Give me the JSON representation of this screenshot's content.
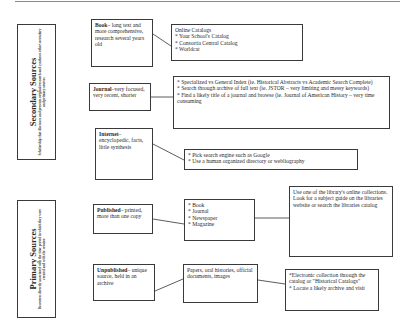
{
  "sections": {
    "secondary": {
      "title": "Secondary Sources",
      "subtitle": "Scholarship that discusses and presents original research and syntheses other secondary and primary sources"
    },
    "primary": {
      "title": "Primary Sources",
      "subtitle": "Resources directly associated with the time period in which they were created and with the creator."
    }
  },
  "nodes": {
    "book": {
      "term": "Book",
      "desc": "– long text and more comprehensive, research several years old"
    },
    "online_catalogs": {
      "heading": "Online Catalogs",
      "items": [
        "* Your School's  Catalog",
        "* Consortia Central Catalog",
        "* Worldcat"
      ]
    },
    "journal": {
      "term": "Journal",
      "desc": "–very focused, very recent, shorter"
    },
    "index": {
      "items": [
        "* Specialized vs General Index (ie. Historical Abstracts vs Academic Search Complete)",
        "* Search through archive of full text (ie. JSTOR – very limiting and messy keywords)",
        "* Find a likely title of a journal and browse (ie. Journal of American History – very time consuming"
      ]
    },
    "internet": {
      "term": "Internet",
      "desc": "– encyclopedic, facts, little synthesis"
    },
    "search_engine": {
      "items": [
        "* Pick search engine such as Google",
        "* Use a human organized directory or webliography"
      ]
    },
    "published": {
      "term": "Published",
      "desc": "– printed, more than one copy"
    },
    "published_types": {
      "items": [
        "* Book",
        "* Journal",
        "* Newspaper",
        "* Magazine"
      ]
    },
    "library_collections": {
      "text": "Use one of the library's online collections. Look for a subject guide on the libraries website or search the libraries catalog"
    },
    "unpublished": {
      "term": "Unpublished",
      "desc": "– unique source, held in an archive"
    },
    "unpublished_types": {
      "text": "Papers, oral histories, official documents, images"
    },
    "archive_search": {
      "items": [
        "*Electronic collection through the catalog or \"Historical Catalogs\"",
        "* Locate a likely archive and visit"
      ]
    }
  }
}
